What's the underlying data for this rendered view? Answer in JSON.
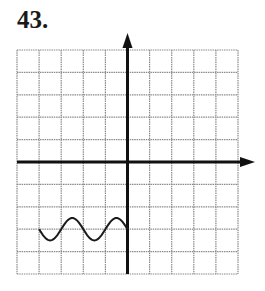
{
  "problem_number": "43.",
  "chart_data": {
    "type": "line",
    "title": "",
    "xlabel": "",
    "ylabel": "",
    "grid": true,
    "xlim": [
      -5,
      5
    ],
    "ylim": [
      -5,
      5
    ],
    "x_ticks": [
      -5,
      -4,
      -3,
      -2,
      -1,
      0,
      1,
      2,
      3,
      4,
      5
    ],
    "y_ticks": [
      -5,
      -4,
      -3,
      -2,
      -1,
      0,
      1,
      2,
      3,
      4,
      5
    ],
    "axes_arrows": [
      "positive-x",
      "positive-y"
    ],
    "series": [
      {
        "name": "curve",
        "description": "sinusoid on domain [-4, 0], midline y=-3, amplitude 0.5, period 2",
        "x": [
          -4,
          -3.5,
          -3,
          -2.5,
          -2,
          -1.5,
          -1,
          -0.5,
          0
        ],
        "y": [
          -3,
          -3.5,
          -3,
          -2.5,
          -3,
          -3.5,
          -3,
          -2.5,
          -3
        ]
      }
    ]
  },
  "colors": {
    "grid": "#8a8a8a",
    "axes": "#111111",
    "curve": "#1a1a1a"
  }
}
